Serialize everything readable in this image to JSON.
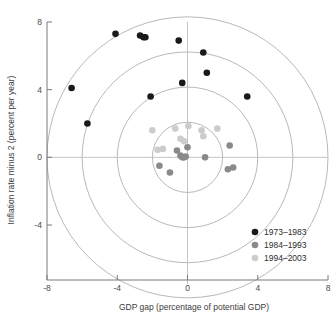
{
  "chart_data": {
    "type": "scatter",
    "title": "",
    "xlabel": "GDP gap (percentage of potential GDP)",
    "ylabel": "Inflation rate minus 2 (percent per year)",
    "xlim": [
      -8,
      8
    ],
    "ylim": [
      -8,
      8
    ],
    "xticks": [
      -8,
      -4,
      0,
      4,
      8
    ],
    "yticks": [
      8,
      4,
      0,
      -4
    ],
    "xtick_labels": [
      "-8",
      "-4",
      "0",
      "4",
      "8"
    ],
    "ytick_labels": [
      "8",
      "4",
      "0",
      "-4"
    ],
    "grid": false,
    "reference_rings": {
      "label": "concentric distance-from-origin circles",
      "radii": [
        2,
        4,
        6,
        8
      ],
      "color": "#b9b9b9"
    },
    "legend": {
      "position": "bottom-right",
      "entries": [
        {
          "label": "1973–1983",
          "color": "#1a1a1a"
        },
        {
          "label": "1984–1993",
          "color": "#8a8a8a"
        },
        {
          "label": "1994–2003",
          "color": "#cccccc"
        }
      ]
    },
    "series": [
      {
        "name": "1973–1983",
        "color": "#1a1a1a",
        "points": [
          {
            "x": -6.6,
            "y": 4.1
          },
          {
            "x": -5.7,
            "y": 2.0
          },
          {
            "x": -4.1,
            "y": 7.3
          },
          {
            "x": -2.7,
            "y": 7.2
          },
          {
            "x": -2.5,
            "y": 7.1
          },
          {
            "x": -2.4,
            "y": 7.1
          },
          {
            "x": -2.1,
            "y": 3.6
          },
          {
            "x": -0.5,
            "y": 6.9
          },
          {
            "x": -0.3,
            "y": 4.4
          },
          {
            "x": 0.9,
            "y": 6.2
          },
          {
            "x": 1.1,
            "y": 5.0
          },
          {
            "x": 3.4,
            "y": 3.6
          }
        ]
      },
      {
        "name": "1984–1993",
        "color": "#8a8a8a",
        "points": [
          {
            "x": -1.6,
            "y": -0.5
          },
          {
            "x": -1.0,
            "y": -0.9
          },
          {
            "x": -0.6,
            "y": 0.4
          },
          {
            "x": -0.4,
            "y": 0.1
          },
          {
            "x": -0.3,
            "y": 0.0
          },
          {
            "x": -0.2,
            "y": 0.0
          },
          {
            "x": -0.1,
            "y": 0.05
          },
          {
            "x": 0.0,
            "y": 0.6
          },
          {
            "x": 1.0,
            "y": 0.0
          },
          {
            "x": 2.3,
            "y": -0.7
          },
          {
            "x": 2.4,
            "y": 0.7
          },
          {
            "x": 2.6,
            "y": -0.6
          }
        ]
      },
      {
        "name": "1994–2003",
        "color": "#cccccc",
        "points": [
          {
            "x": -2.0,
            "y": 1.6
          },
          {
            "x": -1.7,
            "y": 0.45
          },
          {
            "x": -1.4,
            "y": 0.5
          },
          {
            "x": -0.7,
            "y": 1.7
          },
          {
            "x": -0.4,
            "y": 1.1
          },
          {
            "x": -0.2,
            "y": 0.95
          },
          {
            "x": 0.05,
            "y": 1.85
          },
          {
            "x": 0.8,
            "y": 1.6
          },
          {
            "x": 0.9,
            "y": 1.25
          },
          {
            "x": 1.7,
            "y": 1.7
          }
        ]
      }
    ]
  }
}
